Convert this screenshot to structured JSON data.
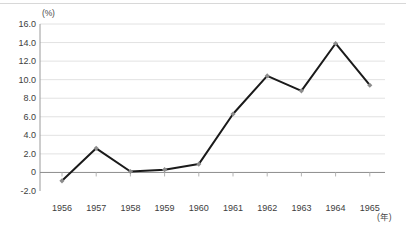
{
  "chart_data": {
    "type": "line",
    "title": "",
    "xlabel": "年",
    "ylabel": "(%)",
    "unit_y": "(%)",
    "unit_x": "(年)",
    "categories": [
      "1956",
      "1957",
      "1958",
      "1959",
      "1960",
      "1961",
      "1962",
      "1963",
      "1964",
      "1965"
    ],
    "values": [
      -0.9,
      2.6,
      0.1,
      0.3,
      0.9,
      6.3,
      10.4,
      8.8,
      13.9,
      9.4
    ],
    "series": [
      {
        "name": "",
        "values": [
          -0.9,
          2.6,
          0.1,
          0.3,
          0.9,
          6.3,
          10.4,
          8.8,
          13.9,
          9.4
        ]
      }
    ],
    "ylim": [
      -2.0,
      16.0
    ],
    "ytick_labels": [
      "16.0",
      "14.0",
      "12.0",
      "10.0",
      "8.0",
      "6.0",
      "4.0",
      "2.0",
      "0",
      "-2.0"
    ],
    "ytick_values": [
      16.0,
      14.0,
      12.0,
      10.0,
      8.0,
      6.0,
      4.0,
      2.0,
      0,
      -2.0
    ],
    "grid": true,
    "legend": "none",
    "zero_line": 0,
    "line_color": "#1a1a1a",
    "marker_color": "#8c8c8c",
    "grid_color": "#e2e2e2",
    "axis_color": "#9a9a9a"
  }
}
